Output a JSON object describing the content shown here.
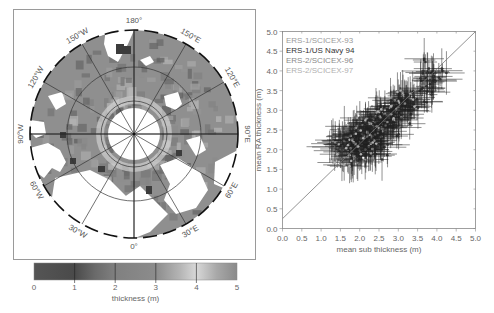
{
  "chart_data": [
    {
      "type": "heatmap",
      "projection": "north-polar-stereographic",
      "title": "",
      "longitude_labels": [
        "180°",
        "150°E",
        "120°E",
        "90°E",
        "60°E",
        "30°E",
        "0°",
        "30°W",
        "60°W",
        "90°W",
        "120°W",
        "150°W"
      ],
      "latitude_circles": 3,
      "colorbar": {
        "label": "thickness (m)",
        "ticks": [
          "0",
          "1",
          "2",
          "3",
          "4",
          "5"
        ],
        "range": [
          0,
          5
        ],
        "stops": [
          {
            "v": 0,
            "color": "#555555"
          },
          {
            "v": 1,
            "color": "#4a4a4a"
          },
          {
            "v": 1.5,
            "color": "#6a6a6a"
          },
          {
            "v": 2,
            "color": "#808080"
          },
          {
            "v": 3,
            "color": "#8c8c8c"
          },
          {
            "v": 3.6,
            "color": "#b5b5b5"
          },
          {
            "v": 4,
            "color": "#d8d8d8"
          },
          {
            "v": 4.5,
            "color": "#a8a8a8"
          },
          {
            "v": 5,
            "color": "#8a8a8a"
          }
        ]
      },
      "land_color": "#ffffff",
      "ocean_color": "#8f8f8f",
      "pole_hole_color": "#ffffff"
    },
    {
      "type": "scatter",
      "title": "",
      "xlabel": "mean sub thickness (m)",
      "ylabel": "mean RA thickness (m)",
      "xlim": [
        0.0,
        5.0
      ],
      "ylim": [
        0.0,
        5.0
      ],
      "xticks": [
        "0.0",
        "0.5",
        "1.0",
        "1.5",
        "2.0",
        "2.5",
        "3.0",
        "3.5",
        "4.0",
        "4.5",
        "5.0"
      ],
      "yticks": [
        "0.0",
        "0.5",
        "1.0",
        "1.5",
        "2.0",
        "2.5",
        "3.0",
        "3.5",
        "4.0",
        "4.5",
        "5.0"
      ],
      "grid": false,
      "legend_position": "upper left",
      "reference_line": {
        "x": [
          0.0,
          5.0
        ],
        "y": [
          0.25,
          5.0
        ]
      },
      "series": [
        {
          "name": "ERS-1/SCICEX-93",
          "color": "#9a9a9a",
          "x": [
            1.5,
            1.7,
            1.9,
            2.1,
            2.3,
            2.5,
            2.2,
            1.8,
            2.6,
            2.0
          ],
          "y": [
            2.2,
            2.4,
            2.3,
            2.5,
            2.4,
            2.6,
            2.1,
            2.0,
            2.7,
            2.2
          ]
        },
        {
          "name": "ERS-1/US Navy 94",
          "color": "#333333",
          "x": [
            2.0,
            2.4,
            2.7,
            3.0,
            3.2,
            3.5,
            3.7,
            3.9,
            2.8,
            3.1,
            2.5,
            3.3,
            3.8,
            4.0
          ],
          "y": [
            2.1,
            2.3,
            2.8,
            3.0,
            3.1,
            3.3,
            3.6,
            4.1,
            2.5,
            2.9,
            2.0,
            3.2,
            3.8,
            3.9
          ]
        },
        {
          "name": "ERS-2/SCICEX-96",
          "color": "#8a8a8a",
          "x": [
            1.4,
            1.6,
            1.8,
            2.0,
            2.2,
            2.4,
            2.6,
            2.8,
            3.0,
            1.9,
            2.3
          ],
          "y": [
            2.1,
            2.0,
            2.2,
            2.3,
            2.4,
            2.5,
            2.7,
            2.8,
            3.0,
            1.9,
            2.2
          ]
        },
        {
          "name": "ERS-2/SCICEX-97",
          "color": "#b0b0b0",
          "x": [
            1.7,
            2.1,
            2.5,
            2.9,
            3.2,
            2.7,
            2.2,
            1.6
          ],
          "y": [
            2.3,
            2.6,
            2.8,
            3.1,
            3.3,
            2.9,
            2.1,
            1.8
          ]
        }
      ]
    }
  ]
}
